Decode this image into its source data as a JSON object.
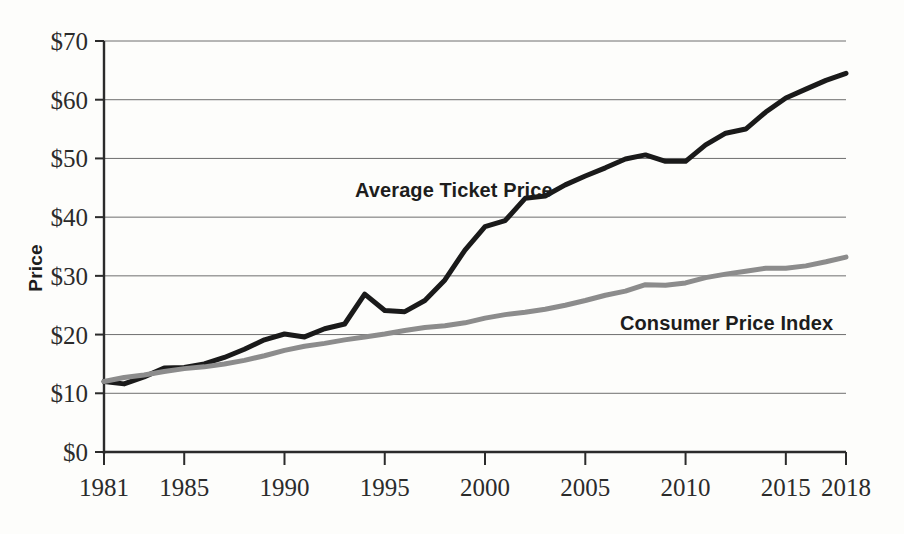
{
  "chart_data": {
    "type": "line",
    "title": "",
    "xlabel": "",
    "ylabel": "Price",
    "xlim": [
      1981,
      2018
    ],
    "ylim": [
      0,
      70
    ],
    "grid": true,
    "legend_position": "inline-annotations",
    "y_tick_labels": [
      "$70",
      "$60",
      "$50",
      "$40",
      "$30",
      "$20",
      "$10",
      "$0"
    ],
    "y_tick_values": [
      70,
      60,
      50,
      40,
      30,
      20,
      10,
      0
    ],
    "x_tick_labels": [
      "1981",
      "1985",
      "1990",
      "1995",
      "2000",
      "2005",
      "2010",
      "2015",
      "2018"
    ],
    "x_tick_values": [
      1981,
      1985,
      1990,
      1995,
      2000,
      2005,
      2010,
      2015,
      2018
    ],
    "x": [
      1981,
      1982,
      1983,
      1984,
      1985,
      1986,
      1987,
      1988,
      1989,
      1990,
      1991,
      1992,
      1993,
      1994,
      1995,
      1996,
      1997,
      1998,
      1999,
      2000,
      2001,
      2002,
      2003,
      2004,
      2005,
      2006,
      2007,
      2008,
      2009,
      2010,
      2011,
      2012,
      2013,
      2014,
      2015,
      2016,
      2017,
      2018
    ],
    "series": [
      {
        "name": "Average Ticket Price",
        "color": "#1a1a1a",
        "stroke_width": 5,
        "label_anchor_year": 1995,
        "values": [
          12.0,
          11.6,
          12.8,
          14.3,
          14.4,
          15.0,
          16.1,
          17.5,
          19.1,
          20.1,
          19.6,
          21.0,
          21.8,
          26.9,
          24.1,
          23.9,
          25.8,
          29.3,
          34.4,
          38.4,
          39.4,
          43.2,
          43.6,
          45.5,
          47.0,
          48.4,
          49.9,
          50.6,
          49.5,
          49.5,
          52.3,
          54.3,
          55.0,
          57.9,
          60.3,
          61.8,
          63.3,
          64.5
        ]
      },
      {
        "name": "Consumer Price Index",
        "color": "#8c8c8c",
        "stroke_width": 5,
        "label_anchor_year": 2008,
        "values": [
          12.0,
          12.7,
          13.1,
          13.7,
          14.2,
          14.5,
          15.0,
          15.6,
          16.4,
          17.3,
          18.0,
          18.5,
          19.1,
          19.6,
          20.1,
          20.7,
          21.2,
          21.5,
          22.0,
          22.8,
          23.4,
          23.8,
          24.3,
          25.0,
          25.8,
          26.7,
          27.4,
          28.5,
          28.4,
          28.8,
          29.7,
          30.3,
          30.8,
          31.3,
          31.3,
          31.7,
          32.4,
          33.2
        ]
      }
    ],
    "annotations": [
      {
        "text": "Average Ticket Price",
        "color": "#1d1d1d"
      },
      {
        "text": "Consumer Price Index",
        "color": "#1d1d1d"
      }
    ]
  }
}
